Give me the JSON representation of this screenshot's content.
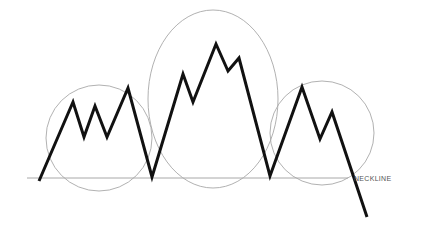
{
  "diagram": {
    "neckline_label": "NECKLINE",
    "colors": {
      "background": "#ffffff",
      "price_line": "#111111",
      "guide_line": "#a8a8a8",
      "label": "#555555"
    },
    "neckline": {
      "x1": 27,
      "y1": 178,
      "x2": 348,
      "y2": 178
    },
    "price_path": [
      [
        39,
        181
      ],
      [
        73,
        102
      ],
      [
        84,
        137
      ],
      [
        95,
        106
      ],
      [
        107,
        137
      ],
      [
        128,
        88
      ],
      [
        152,
        177
      ],
      [
        183,
        74
      ],
      [
        193,
        102
      ],
      [
        216,
        44
      ],
      [
        228,
        71
      ],
      [
        239,
        58
      ],
      [
        270,
        176
      ],
      [
        302,
        87
      ],
      [
        320,
        139
      ],
      [
        332,
        112
      ],
      [
        367,
        217
      ]
    ],
    "regions": [
      {
        "name": "left-shoulder",
        "cx": 99,
        "cy": 138,
        "rx": 53,
        "ry": 53
      },
      {
        "name": "head",
        "cx": 213,
        "cy": 99,
        "rx": 65,
        "ry": 89
      },
      {
        "name": "right-shoulder",
        "cx": 322,
        "cy": 133,
        "rx": 52,
        "ry": 52
      }
    ]
  }
}
